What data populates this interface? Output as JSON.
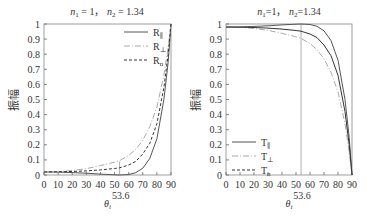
{
  "chart_data": [
    {
      "type": "line",
      "title": "n₁ = 1,  n₂ = 1.34",
      "title_parts": {
        "n1_label": "n",
        "n1_sub": "1",
        "n1_val": " = 1，",
        "n2_label": "n",
        "n2_sub": "2",
        "n2_val": " = 1.34"
      },
      "xlabel": "θ",
      "xlabel_sub": "i",
      "ylabel": "振幅",
      "xlim": [
        0,
        90
      ],
      "ylim": [
        0,
        1
      ],
      "x_ticks": [
        "0",
        "10",
        "20",
        "30",
        "40",
        "50",
        "60",
        "70",
        "80",
        "90"
      ],
      "y_ticks": [
        "0",
        "0.1",
        "0.2",
        "0.3",
        "0.4",
        "0.5",
        "0.6",
        "0.7",
        "0.8",
        "0.9",
        "1"
      ],
      "annotation": {
        "x": 53.6,
        "label": "53.6"
      },
      "legend_position": "upper-right",
      "series": [
        {
          "name": "R∥",
          "label_main": "R",
          "label_sub": "∥",
          "style": "solid",
          "color": "#555555",
          "x": [
            0,
            10,
            20,
            30,
            40,
            50,
            53.6,
            60,
            65,
            70,
            75,
            80,
            85,
            88,
            90
          ],
          "y": [
            0.02,
            0.019,
            0.016,
            0.012,
            0.006,
            0.001,
            0.0,
            0.003,
            0.015,
            0.045,
            0.11,
            0.24,
            0.5,
            0.75,
            1.0
          ]
        },
        {
          "name": "R⊥",
          "label_main": "R",
          "label_sub": "⊥",
          "style": "dashdot",
          "color": "#aaaaaa",
          "x": [
            0,
            10,
            20,
            30,
            40,
            50,
            53.6,
            60,
            65,
            70,
            75,
            80,
            85,
            88,
            90
          ],
          "y": [
            0.02,
            0.022,
            0.03,
            0.042,
            0.062,
            0.085,
            0.095,
            0.13,
            0.17,
            0.23,
            0.32,
            0.45,
            0.66,
            0.85,
            1.0
          ]
        },
        {
          "name": "Rn",
          "label_main": "R",
          "label_sub": "n",
          "style": "dashed",
          "color": "#333333",
          "x": [
            0,
            10,
            20,
            30,
            40,
            50,
            53.6,
            60,
            65,
            70,
            75,
            80,
            85,
            88,
            90
          ],
          "y": [
            0.02,
            0.021,
            0.023,
            0.027,
            0.034,
            0.043,
            0.048,
            0.066,
            0.09,
            0.14,
            0.21,
            0.34,
            0.58,
            0.8,
            1.0
          ]
        }
      ]
    },
    {
      "type": "line",
      "title": "n₁=1,  n₂=1.34",
      "title_parts": {
        "n1_label": "n",
        "n1_sub": "1",
        "n1_val": "=1，",
        "n2_label": "n",
        "n2_sub": "2",
        "n2_val": "=1.34"
      },
      "xlabel": "θ",
      "xlabel_sub": "i",
      "ylabel": "振幅",
      "xlim": [
        0,
        90
      ],
      "ylim": [
        0,
        1
      ],
      "x_ticks": [
        "0",
        "10",
        "20",
        "30",
        "40",
        "50",
        "60",
        "70",
        "80",
        "90"
      ],
      "y_ticks": [
        "0",
        "0.1",
        "0.2",
        "0.3",
        "0.4",
        "0.5",
        "0.6",
        "0.7",
        "0.8",
        "0.9",
        "1"
      ],
      "annotation": {
        "x": 53.6,
        "label": "53.6"
      },
      "legend_position": "lower-left",
      "series": [
        {
          "name": "T∥",
          "label_main": "T",
          "label_sub": "∥",
          "style": "solid",
          "color": "#555555",
          "x": [
            0,
            10,
            20,
            30,
            40,
            50,
            53.6,
            60,
            65,
            70,
            75,
            80,
            85,
            88,
            90
          ],
          "y": [
            0.98,
            0.981,
            0.984,
            0.988,
            0.994,
            0.999,
            1.0,
            0.997,
            0.985,
            0.955,
            0.89,
            0.76,
            0.5,
            0.25,
            0.0
          ]
        },
        {
          "name": "T⊥",
          "label_main": "T",
          "label_sub": "⊥",
          "style": "dashdot",
          "color": "#aaaaaa",
          "x": [
            0,
            10,
            20,
            30,
            40,
            50,
            53.6,
            60,
            65,
            70,
            75,
            80,
            85,
            88,
            90
          ],
          "y": [
            0.98,
            0.978,
            0.97,
            0.958,
            0.938,
            0.915,
            0.905,
            0.87,
            0.83,
            0.77,
            0.68,
            0.55,
            0.34,
            0.15,
            0.0
          ]
        },
        {
          "name": "Tn",
          "label_main": "T",
          "label_sub": "n",
          "style": "solid",
          "color": "#333333",
          "x": [
            0,
            10,
            20,
            30,
            40,
            50,
            53.6,
            60,
            65,
            70,
            75,
            80,
            85,
            88,
            90
          ],
          "y": [
            0.98,
            0.979,
            0.977,
            0.973,
            0.966,
            0.957,
            0.952,
            0.934,
            0.91,
            0.86,
            0.79,
            0.66,
            0.42,
            0.2,
            0.0
          ]
        }
      ]
    }
  ]
}
